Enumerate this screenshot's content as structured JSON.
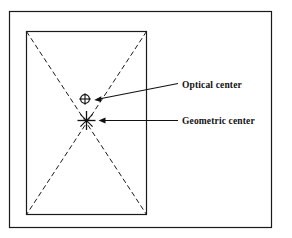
{
  "figure": {
    "background_color": "#ffffff",
    "line_color": "#1a1a1a",
    "text_color": "#111111",
    "width": 292,
    "height": 238
  },
  "outer_frame": {
    "name": "outer border",
    "x": 9,
    "y": 11,
    "width": 263,
    "height": 217,
    "stroke_width": 1.2
  },
  "page_rectangle": {
    "name": "page outline",
    "x": 26,
    "y": 31,
    "width": 121,
    "height": 184,
    "stroke_width": 1.2
  },
  "diagonals": {
    "name": "dashed diagonals",
    "style": "dashed",
    "dash_pattern": "5,3",
    "stroke_width": 1.0
  },
  "markers": {
    "optical_center": {
      "symbol": "circle-with-crosshair",
      "x": 85,
      "y": 99,
      "radius": 4.6
    },
    "geometric_center": {
      "symbol": "asterisk-cross",
      "x": 86.5,
      "y": 120.5,
      "size": 8
    }
  },
  "leaders": {
    "optical": {
      "from_x": 178,
      "from_y": 84,
      "to_x": 96,
      "to_y": 99.5,
      "arrow": "end"
    },
    "geometric": {
      "from_x": 178,
      "from_y": 120.5,
      "to_x": 99,
      "to_y": 120.5,
      "arrow": "end"
    }
  },
  "labels": {
    "optical_center": "Optical center",
    "geometric_center": "Geometric center",
    "optical_center_x": 182,
    "optical_center_y": 87,
    "geometric_center_x": 182,
    "geometric_center_y": 124
  }
}
